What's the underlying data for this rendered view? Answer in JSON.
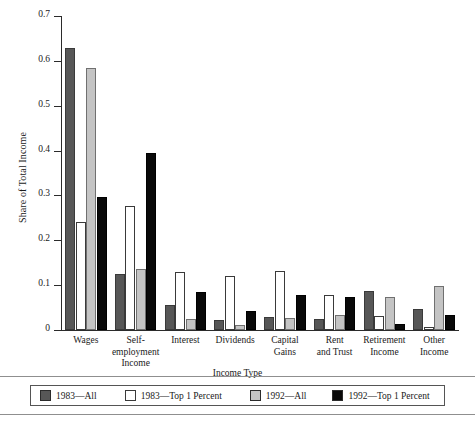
{
  "chart_data": {
    "type": "bar",
    "title": "",
    "xlabel": "Income Type",
    "ylabel": "Share of Total Income",
    "ylim": [
      0,
      0.7
    ],
    "ytick_labels": [
      "0",
      "0.1",
      "0.2",
      "0.3",
      "0.4",
      "0.5",
      "0.6",
      "0.7"
    ],
    "ytick_values": [
      0,
      0.1,
      0.2,
      0.3,
      0.4,
      0.5,
      0.6,
      0.7
    ],
    "grid": false,
    "legend_position": "below-plot",
    "categories": [
      "Wages",
      "Self-employment Income",
      "Interest",
      "Dividends",
      "Capital Gains",
      "Rent and Trust",
      "Retirement Income",
      "Other Income"
    ],
    "category_lines": [
      [
        "Wages"
      ],
      [
        "Self-",
        "employment",
        "Income"
      ],
      [
        "Interest"
      ],
      [
        "Dividends"
      ],
      [
        "Capital",
        "Gains"
      ],
      [
        "Rent",
        "and Trust"
      ],
      [
        "Retirement",
        "Income"
      ],
      [
        "Other",
        "Income"
      ]
    ],
    "series": [
      {
        "name": "1983—All",
        "color": "#575757",
        "values": [
          0.628,
          0.125,
          0.055,
          0.023,
          0.03,
          0.024,
          0.086,
          0.047
        ]
      },
      {
        "name": "1983—Top 1 Percent",
        "color": "#ffffff",
        "values": [
          0.24,
          0.277,
          0.13,
          0.12,
          0.131,
          0.079,
          0.032,
          0.006
        ]
      },
      {
        "name": "1992—All",
        "color": "#c4c4c4",
        "values": [
          0.585,
          0.137,
          0.024,
          0.012,
          0.027,
          0.034,
          0.073,
          0.098
        ]
      },
      {
        "name": "1992—Top 1 Percent",
        "color": "#090909",
        "values": [
          0.297,
          0.394,
          0.085,
          0.043,
          0.077,
          0.073,
          0.013,
          0.033
        ]
      }
    ]
  }
}
